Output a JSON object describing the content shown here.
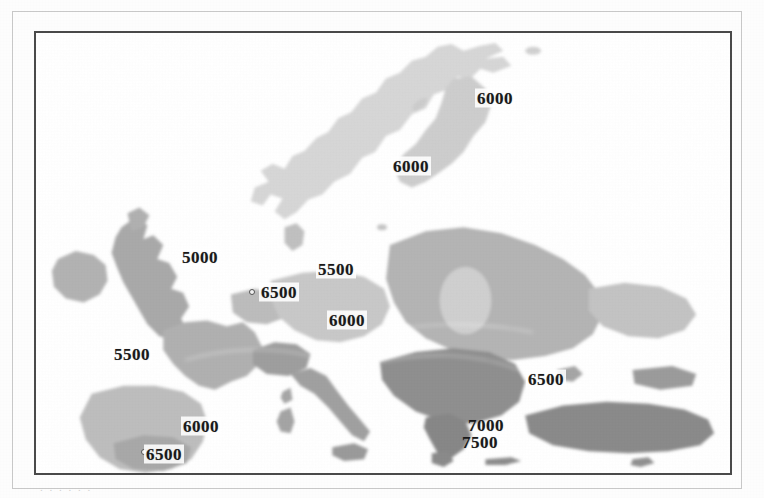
{
  "figure": {
    "kind": "scanned-contour-map",
    "region_title": "Europe",
    "caption_stub": ". . .  .  . .",
    "frame_color": "#4a4a4a",
    "outer_frame_color": "#c9c9c9",
    "background_color": "#ffffff"
  },
  "legend_scale": {
    "min_value": 5000,
    "max_value": 7500,
    "step": 500,
    "units_implied": "annual irradiation (Wh/m2 per day, scanned isolines)",
    "shades": [
      {
        "value": 5000,
        "hex": "#dcdcdc"
      },
      {
        "value": 5500,
        "hex": "#cfcfcf"
      },
      {
        "value": 6000,
        "hex": "#bdbdbd"
      },
      {
        "value": 6500,
        "hex": "#a9a9a9"
      },
      {
        "value": 7000,
        "hex": "#949494"
      },
      {
        "value": 7500,
        "hex": "#7e7e7e"
      }
    ]
  },
  "chart_data": {
    "type": "heatmap",
    "title": "",
    "xlabel": "",
    "ylabel": "",
    "grid": false,
    "legend_position": "none",
    "contour_levels": [
      5000,
      5500,
      6000,
      6500,
      7000,
      7500
    ],
    "labels": [
      {
        "id": "lbl-north-scandinavia",
        "value": "6000",
        "x": 493,
        "y": 96,
        "boxed": true,
        "dot": false
      },
      {
        "id": "lbl-mid-scandinavia",
        "value": "6000",
        "x": 409,
        "y": 164,
        "boxed": true,
        "dot": false
      },
      {
        "id": "lbl-british-isles",
        "value": "5000",
        "x": 198,
        "y": 255,
        "boxed": true,
        "dot": false
      },
      {
        "id": "lbl-baltic",
        "value": "5500",
        "x": 334,
        "y": 267,
        "boxed": true,
        "dot": false
      },
      {
        "id": "lbl-alps",
        "value": "6500",
        "x": 277,
        "y": 290,
        "boxed": true,
        "dot": true,
        "dot_x": 250,
        "dot_y": 290
      },
      {
        "id": "lbl-carpathians",
        "value": "6000",
        "x": 345,
        "y": 318,
        "boxed": true,
        "dot": false
      },
      {
        "id": "lbl-biscay",
        "value": "5500",
        "x": 130,
        "y": 352,
        "boxed": true,
        "dot": false
      },
      {
        "id": "lbl-black-sea",
        "value": "6500",
        "x": 544,
        "y": 377,
        "boxed": true,
        "dot": false
      },
      {
        "id": "lbl-iberia-north",
        "value": "6000",
        "x": 199,
        "y": 424,
        "boxed": true,
        "dot": false
      },
      {
        "id": "lbl-aegean-7000",
        "value": "7000",
        "x": 484,
        "y": 423,
        "boxed": false,
        "dot": false
      },
      {
        "id": "lbl-aegean-7500",
        "value": "7500",
        "x": 478,
        "y": 440,
        "boxed": false,
        "dot": false
      },
      {
        "id": "lbl-iberia-south",
        "value": "6500",
        "x": 162,
        "y": 452,
        "boxed": true,
        "dot": true,
        "dot_x": 142,
        "dot_y": 450
      }
    ],
    "regions": [
      {
        "name": "scandinavia",
        "shade": "#d7d7d7",
        "approx_value": 6000
      },
      {
        "name": "british-isles",
        "shade": "#aeaeae",
        "approx_value": 5000
      },
      {
        "name": "ireland",
        "shade": "#b4b4b4",
        "approx_value": 5000
      },
      {
        "name": "france",
        "shade": "#b0b0b0",
        "approx_value": 6000
      },
      {
        "name": "iberia",
        "shade": "#bdbdbd",
        "approx_value": 6500
      },
      {
        "name": "alps-central",
        "shade": "#a6a6a6",
        "approx_value": 6500
      },
      {
        "name": "germany-poland",
        "shade": "#c6c6c6",
        "approx_value": 5500
      },
      {
        "name": "east-europe",
        "shade": "#b2b2b2",
        "approx_value": 6000
      },
      {
        "name": "balkans",
        "shade": "#8f8f8f",
        "approx_value": 7000
      },
      {
        "name": "greece",
        "shade": "#858585",
        "approx_value": 7500
      },
      {
        "name": "italy",
        "shade": "#9d9d9d",
        "approx_value": 6500
      },
      {
        "name": "turkey",
        "shade": "#8a8a8a",
        "approx_value": 7000
      },
      {
        "name": "black-sea-rim",
        "shade": "#c3c3c3",
        "approx_value": 6500
      }
    ]
  }
}
